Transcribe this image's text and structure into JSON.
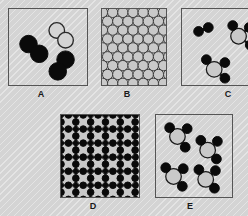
{
  "figure": {
    "background_color": "#d4d4d4",
    "width": 248,
    "height": 216
  },
  "colors": {
    "background": "#d4d4d4",
    "panel_border": "#555555",
    "atom_dark": "#0a0a0a",
    "atom_gray": "#c9c9c9",
    "atom_outline": "#1a1a1a",
    "atom_open_fill": "#d4d4d4",
    "bond": "#1a1a1a"
  },
  "panels": [
    {
      "id": "A",
      "label": "A",
      "description": "Three diatomic molecules: two filled dark pairs and one open/outlined pair",
      "x": 8,
      "y": 8,
      "width": 80,
      "height": 78,
      "label_x": 41,
      "label_y": 89,
      "content_type": "molecules",
      "molecules": [
        {
          "kind": "diatomic-dark",
          "atoms": [
            {
              "cx": 20,
              "cy": 36,
              "r": 9,
              "fill": "#0a0a0a",
              "stroke": "#0a0a0a"
            },
            {
              "cx": 31,
              "cy": 46,
              "r": 9,
              "fill": "#0a0a0a",
              "stroke": "#0a0a0a"
            }
          ]
        },
        {
          "kind": "diatomic-open",
          "atoms": [
            {
              "cx": 49,
              "cy": 22,
              "r": 8,
              "fill": "#d4d4d4",
              "stroke": "#2a2a2a"
            },
            {
              "cx": 58,
              "cy": 32,
              "r": 8,
              "fill": "#d4d4d4",
              "stroke": "#2a2a2a"
            }
          ]
        },
        {
          "kind": "diatomic-dark",
          "atoms": [
            {
              "cx": 58,
              "cy": 52,
              "r": 9,
              "fill": "#0a0a0a",
              "stroke": "#0a0a0a"
            },
            {
              "cx": 50,
              "cy": 64,
              "r": 9,
              "fill": "#0a0a0a",
              "stroke": "#0a0a0a"
            }
          ]
        }
      ]
    },
    {
      "id": "B",
      "label": "B",
      "description": "Close-packed hexagonal lattice of identical gray atoms (pure metallic solid)",
      "x": 101,
      "y": 8,
      "width": 66,
      "height": 78,
      "label_x": 127,
      "label_y": 89,
      "content_type": "lattice-hex",
      "lattice": {
        "radius": 5.3,
        "spacing_x": 10.5,
        "spacing_y": 9.1,
        "rows": 9,
        "cols": 7,
        "fill": "#c9c9c9",
        "stroke": "#3a3a3a"
      }
    },
    {
      "id": "C",
      "label": "C",
      "description": "Mixture: one dark diatomic molecule plus triatomic molecules of a gray atom bonded to dark atoms",
      "x": 181,
      "y": 8,
      "width": 80,
      "height": 78,
      "label_x": 228,
      "label_y": 89,
      "content_type": "molecules",
      "molecules": [
        {
          "kind": "diatomic-dark",
          "atoms": [
            {
              "cx": 17,
              "cy": 23,
              "r": 5,
              "fill": "#0a0a0a",
              "stroke": "#0a0a0a"
            },
            {
              "cx": 27,
              "cy": 19,
              "r": 5,
              "fill": "#0a0a0a",
              "stroke": "#0a0a0a"
            }
          ]
        },
        {
          "kind": "triatomic-mixed",
          "center": {
            "cx": 58,
            "cy": 28,
            "r": 8,
            "fill": "#c9c9c9",
            "stroke": "#1a1a1a"
          },
          "atoms": [
            {
              "cx": 52,
              "cy": 17,
              "r": 5,
              "fill": "#0a0a0a",
              "stroke": "#0a0a0a"
            },
            {
              "cx": 69,
              "cy": 19,
              "r": 5,
              "fill": "#0a0a0a",
              "stroke": "#0a0a0a"
            },
            {
              "cx": 70,
              "cy": 37,
              "r": 5,
              "fill": "#0a0a0a",
              "stroke": "#0a0a0a"
            }
          ]
        },
        {
          "kind": "triatomic-mixed",
          "center": {
            "cx": 33,
            "cy": 62,
            "r": 8,
            "fill": "#c9c9c9",
            "stroke": "#1a1a1a"
          },
          "atoms": [
            {
              "cx": 25,
              "cy": 52,
              "r": 5,
              "fill": "#0a0a0a",
              "stroke": "#0a0a0a"
            },
            {
              "cx": 44,
              "cy": 55,
              "r": 5,
              "fill": "#0a0a0a",
              "stroke": "#0a0a0a"
            },
            {
              "cx": 44,
              "cy": 71,
              "r": 5,
              "fill": "#0a0a0a",
              "stroke": "#0a0a0a"
            }
          ]
        }
      ]
    },
    {
      "id": "D",
      "label": "D",
      "description": "Ionic crystal lattice: large gray ions alternating with small dark ions in a regular repeating array",
      "x": 60,
      "y": 114,
      "width": 80,
      "height": 84,
      "label_x": 93,
      "label_y": 201,
      "content_type": "lattice-ionic",
      "lattice": {
        "large_radius": 7.8,
        "small_radius": 3.4,
        "spacing_x": 15.2,
        "spacing_y": 14.4,
        "rows": 6,
        "cols": 5,
        "large_fill": "#c9c9c9",
        "large_stroke": "#2a2a2a",
        "small_fill": "#0a0a0a",
        "small_stroke": "#0a0a0a"
      }
    },
    {
      "id": "E",
      "label": "E",
      "description": "Four identical triatomic molecules, each a gray central atom bonded to three dark atoms",
      "x": 155,
      "y": 114,
      "width": 78,
      "height": 84,
      "label_x": 190,
      "label_y": 201,
      "content_type": "molecules",
      "molecules": [
        {
          "kind": "triatomic-mixed",
          "center": {
            "cx": 22,
            "cy": 22,
            "r": 8,
            "fill": "#c9c9c9",
            "stroke": "#1a1a1a"
          },
          "atoms": [
            {
              "cx": 14,
              "cy": 13,
              "r": 5,
              "fill": "#0a0a0a",
              "stroke": "#0a0a0a"
            },
            {
              "cx": 32,
              "cy": 14,
              "r": 5,
              "fill": "#0a0a0a",
              "stroke": "#0a0a0a"
            },
            {
              "cx": 30,
              "cy": 33,
              "r": 5,
              "fill": "#0a0a0a",
              "stroke": "#0a0a0a"
            }
          ]
        },
        {
          "kind": "triatomic-mixed",
          "center": {
            "cx": 53,
            "cy": 36,
            "r": 8,
            "fill": "#c9c9c9",
            "stroke": "#1a1a1a"
          },
          "atoms": [
            {
              "cx": 46,
              "cy": 26,
              "r": 5,
              "fill": "#0a0a0a",
              "stroke": "#0a0a0a"
            },
            {
              "cx": 63,
              "cy": 27,
              "r": 5,
              "fill": "#0a0a0a",
              "stroke": "#0a0a0a"
            },
            {
              "cx": 62,
              "cy": 45,
              "r": 5,
              "fill": "#0a0a0a",
              "stroke": "#0a0a0a"
            }
          ]
        },
        {
          "kind": "triatomic-mixed",
          "center": {
            "cx": 18,
            "cy": 63,
            "r": 8,
            "fill": "#c9c9c9",
            "stroke": "#1a1a1a"
          },
          "atoms": [
            {
              "cx": 10,
              "cy": 54,
              "r": 5,
              "fill": "#0a0a0a",
              "stroke": "#0a0a0a"
            },
            {
              "cx": 28,
              "cy": 55,
              "r": 5,
              "fill": "#0a0a0a",
              "stroke": "#0a0a0a"
            },
            {
              "cx": 27,
              "cy": 73,
              "r": 5,
              "fill": "#0a0a0a",
              "stroke": "#0a0a0a"
            }
          ]
        },
        {
          "kind": "triatomic-mixed",
          "center": {
            "cx": 51,
            "cy": 66,
            "r": 8,
            "fill": "#c9c9c9",
            "stroke": "#1a1a1a"
          },
          "atoms": [
            {
              "cx": 44,
              "cy": 56,
              "r": 5,
              "fill": "#0a0a0a",
              "stroke": "#0a0a0a"
            },
            {
              "cx": 61,
              "cy": 57,
              "r": 5,
              "fill": "#0a0a0a",
              "stroke": "#0a0a0a"
            },
            {
              "cx": 60,
              "cy": 75,
              "r": 5,
              "fill": "#0a0a0a",
              "stroke": "#0a0a0a"
            }
          ]
        }
      ]
    }
  ]
}
